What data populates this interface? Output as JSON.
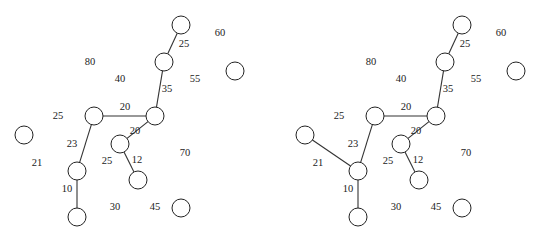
{
  "figure": {
    "node_radius": 9,
    "colors": {
      "stroke": "#222222",
      "background": "#ffffff",
      "text": "#222222"
    }
  },
  "panels": [
    {
      "name": "left",
      "offset_x": 0,
      "nodes": [
        {
          "id": "A",
          "x": 181,
          "y": 25
        },
        {
          "id": "B",
          "x": 164,
          "y": 62
        },
        {
          "id": "R",
          "x": 235,
          "y": 71
        },
        {
          "id": "C",
          "x": 155,
          "y": 116
        },
        {
          "id": "D",
          "x": 94,
          "y": 116
        },
        {
          "id": "E",
          "x": 24,
          "y": 135
        },
        {
          "id": "F",
          "x": 120,
          "y": 144
        },
        {
          "id": "G",
          "x": 77,
          "y": 171
        },
        {
          "id": "H",
          "x": 138,
          "y": 180
        },
        {
          "id": "I",
          "x": 77,
          "y": 217
        },
        {
          "id": "J",
          "x": 181,
          "y": 208
        }
      ],
      "edges": [
        {
          "from": "A",
          "to": "B",
          "weight": "25"
        },
        {
          "from": "B",
          "to": "C",
          "weight": "35"
        },
        {
          "from": "D",
          "to": "C",
          "weight": "20"
        },
        {
          "from": "C",
          "to": "F",
          "weight": "20"
        },
        {
          "from": "F",
          "to": "H",
          "weight": "12"
        },
        {
          "from": "D",
          "to": "G",
          "weight": "23"
        },
        {
          "from": "G",
          "to": "I",
          "weight": "10"
        }
      ],
      "labels": [
        {
          "text": "60",
          "x": 220,
          "y": 34
        },
        {
          "text": "25",
          "x": 184,
          "y": 45
        },
        {
          "text": "80",
          "x": 90,
          "y": 63
        },
        {
          "text": "40",
          "x": 120,
          "y": 80
        },
        {
          "text": "55",
          "x": 195,
          "y": 80
        },
        {
          "text": "35",
          "x": 167,
          "y": 90
        },
        {
          "text": "20",
          "x": 125,
          "y": 108
        },
        {
          "text": "25",
          "x": 58,
          "y": 117
        },
        {
          "text": "20",
          "x": 135,
          "y": 132
        },
        {
          "text": "23",
          "x": 72,
          "y": 145
        },
        {
          "text": "21",
          "x": 37,
          "y": 164
        },
        {
          "text": "70",
          "x": 185,
          "y": 154
        },
        {
          "text": "25",
          "x": 107,
          "y": 162
        },
        {
          "text": "12",
          "x": 137,
          "y": 161
        },
        {
          "text": "10",
          "x": 67,
          "y": 190
        },
        {
          "text": "30",
          "x": 115,
          "y": 208
        },
        {
          "text": "45",
          "x": 155,
          "y": 208
        }
      ]
    },
    {
      "name": "right",
      "offset_x": 281,
      "nodes": [
        {
          "id": "A",
          "x": 181,
          "y": 25
        },
        {
          "id": "B",
          "x": 164,
          "y": 62
        },
        {
          "id": "R",
          "x": 235,
          "y": 71
        },
        {
          "id": "C",
          "x": 155,
          "y": 116
        },
        {
          "id": "D",
          "x": 94,
          "y": 116
        },
        {
          "id": "E",
          "x": 24,
          "y": 135
        },
        {
          "id": "F",
          "x": 120,
          "y": 144
        },
        {
          "id": "G",
          "x": 77,
          "y": 171
        },
        {
          "id": "H",
          "x": 138,
          "y": 180
        },
        {
          "id": "I",
          "x": 77,
          "y": 217
        },
        {
          "id": "J",
          "x": 181,
          "y": 208
        }
      ],
      "edges": [
        {
          "from": "A",
          "to": "B",
          "weight": "25"
        },
        {
          "from": "B",
          "to": "C",
          "weight": "35"
        },
        {
          "from": "D",
          "to": "C",
          "weight": "20"
        },
        {
          "from": "C",
          "to": "F",
          "weight": "20"
        },
        {
          "from": "F",
          "to": "H",
          "weight": "12"
        },
        {
          "from": "D",
          "to": "G",
          "weight": "23"
        },
        {
          "from": "G",
          "to": "I",
          "weight": "10"
        },
        {
          "from": "E",
          "to": "G",
          "weight": "21"
        }
      ],
      "labels": [
        {
          "text": "60",
          "x": 220,
          "y": 34
        },
        {
          "text": "25",
          "x": 184,
          "y": 45
        },
        {
          "text": "80",
          "x": 90,
          "y": 63
        },
        {
          "text": "40",
          "x": 120,
          "y": 80
        },
        {
          "text": "55",
          "x": 195,
          "y": 80
        },
        {
          "text": "35",
          "x": 167,
          "y": 90
        },
        {
          "text": "20",
          "x": 125,
          "y": 108
        },
        {
          "text": "25",
          "x": 58,
          "y": 117
        },
        {
          "text": "20",
          "x": 135,
          "y": 132
        },
        {
          "text": "23",
          "x": 72,
          "y": 145
        },
        {
          "text": "21",
          "x": 37,
          "y": 164
        },
        {
          "text": "70",
          "x": 185,
          "y": 154
        },
        {
          "text": "25",
          "x": 107,
          "y": 162
        },
        {
          "text": "12",
          "x": 137,
          "y": 161
        },
        {
          "text": "10",
          "x": 67,
          "y": 190
        },
        {
          "text": "30",
          "x": 115,
          "y": 208
        },
        {
          "text": "45",
          "x": 155,
          "y": 208
        }
      ]
    }
  ]
}
